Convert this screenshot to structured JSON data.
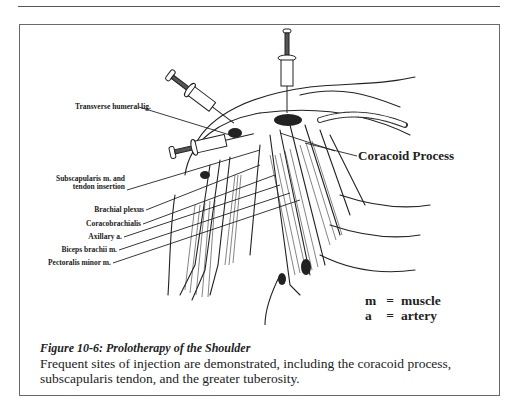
{
  "figure": {
    "labels": {
      "transverse_humeral": "Transverse humeral lig.",
      "subscapularis_line1": "Subscapularis m. and",
      "subscapularis_line2": "tendon insertion",
      "brachial_plexus": "Brachial plexus",
      "coracobrachialis": "Coracobrachialis",
      "axillary": "Axillary a.",
      "biceps": "Biceps brachii m.",
      "pectoralis": "Pectoralis minor m.",
      "coracoid": "Coracoid Process"
    },
    "legend": [
      {
        "key": "m",
        "eq": "=",
        "value": "muscle"
      },
      {
        "key": "a",
        "eq": "=",
        "value": "artery"
      }
    ],
    "caption": {
      "title": "Figure 10-6: Prolotherapy of the Shoulder",
      "body": "Frequent sites of injection are demonstrated, including the coracoid process, subscapularis tendon, and the greater tuberosity."
    }
  }
}
